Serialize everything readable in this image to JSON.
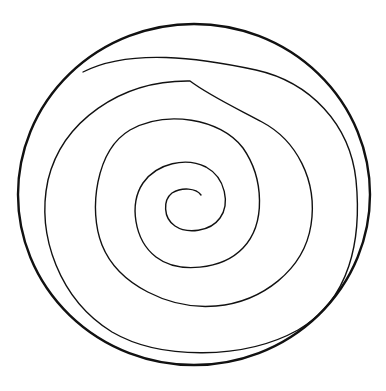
{
  "figure": {
    "elements": [
      {
        "name": "outer-circle",
        "shape": "ellipse",
        "stroke_width": 2.4
      },
      {
        "name": "spiral",
        "shape": "spiral",
        "turns": 4.5,
        "stroke_width": 1.4
      }
    ],
    "colors": {
      "background": "#ffffff",
      "stroke": "#111111"
    }
  }
}
